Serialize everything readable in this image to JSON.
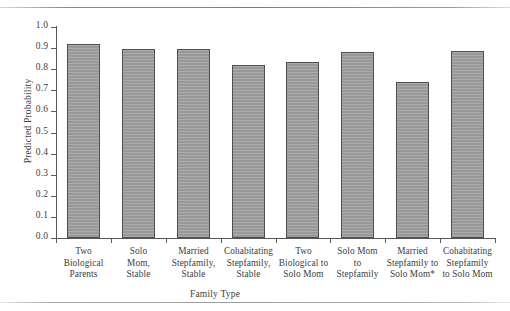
{
  "page": {
    "running_head": ""
  },
  "chart_data": {
    "type": "bar",
    "title": "",
    "xlabel": "Family Type",
    "ylabel": "Predicted Probability",
    "ylim": [
      0.0,
      1.0
    ],
    "ytick_labels": [
      "1.0",
      "0.9",
      "0.8",
      "0.7",
      "0.6",
      "0.5",
      "0.4",
      "0.3",
      "0.2",
      "0.1",
      "0.0"
    ],
    "yticks": [
      1.0,
      0.9,
      0.8,
      0.7,
      0.6,
      0.5,
      0.4,
      0.3,
      0.2,
      0.1,
      0.0
    ],
    "grid": false,
    "legend": null,
    "bar_color": "#9d9d9d",
    "bar_edge_color": "#4f4f4f",
    "categories": [
      "Two\nBiological\nParents",
      "Solo\nMom,\nStable",
      "Married\nStepfamily,\nStable",
      "Cohabitating\nStepfamily,\nStable",
      "Two\nBiological to\nSolo Mom",
      "Solo Mom\nto\nStepfamily",
      "Married\nStepfamily to\nSolo Mom*",
      "Cohabitating\nStepfamily\nto Solo Mom"
    ],
    "category_lines": [
      [
        "Two",
        "Biological",
        "Parents"
      ],
      [
        "Solo",
        "Mom,",
        "Stable"
      ],
      [
        "Married",
        "Stepfamily,",
        "Stable"
      ],
      [
        "Cohabitating",
        "Stepfamily,",
        "Stable"
      ],
      [
        "Two",
        "Biological to",
        "Solo Mom"
      ],
      [
        "Solo Mom",
        "to",
        "Stepfamily"
      ],
      [
        "Married",
        "Stepfamily to",
        "Solo Mom*"
      ],
      [
        "Cohabitating",
        "Stepfamily",
        "to Solo Mom"
      ]
    ],
    "values": [
      0.92,
      0.895,
      0.895,
      0.82,
      0.835,
      0.88,
      0.74,
      0.885
    ]
  }
}
